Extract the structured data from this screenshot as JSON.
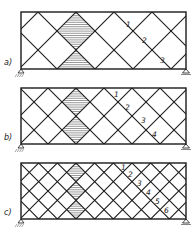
{
  "figure": {
    "line_color": "#1a1a1a",
    "hatch_color": "#555555",
    "background": "#ffffff",
    "panels": [
      {
        "id": "a",
        "label": "a)",
        "rect": {
          "x": 21,
          "y": 12,
          "w": 165,
          "h": 57
        },
        "half_units_vertical": 3,
        "hatch_center_x": 76,
        "numbers": [
          {
            "text": "1",
            "x": 126,
            "y": 27
          },
          {
            "text": "2",
            "x": 142,
            "y": 43
          },
          {
            "text": "3",
            "x": 160,
            "y": 63
          }
        ]
      },
      {
        "id": "b",
        "label": "b)",
        "rect": {
          "x": 21,
          "y": 88,
          "w": 165,
          "h": 56
        },
        "half_units_vertical": 4,
        "hatch_center_x": 76,
        "numbers": [
          {
            "text": "1",
            "x": 114,
            "y": 97
          },
          {
            "text": "2",
            "x": 125,
            "y": 110
          },
          {
            "text": "3",
            "x": 141,
            "y": 123
          },
          {
            "text": "4",
            "x": 152,
            "y": 137
          }
        ]
      },
      {
        "id": "c",
        "label": "c)",
        "rect": {
          "x": 21,
          "y": 163,
          "w": 165,
          "h": 56
        },
        "half_units_vertical": 6,
        "hatch_center_x": 76,
        "numbers": [
          {
            "text": "1",
            "x": 121,
            "y": 170
          },
          {
            "text": "2",
            "x": 128,
            "y": 177
          },
          {
            "text": "3",
            "x": 137,
            "y": 186
          },
          {
            "text": "4",
            "x": 146,
            "y": 195
          },
          {
            "text": "5",
            "x": 155,
            "y": 204
          },
          {
            "text": "6",
            "x": 164,
            "y": 213
          }
        ]
      }
    ]
  }
}
